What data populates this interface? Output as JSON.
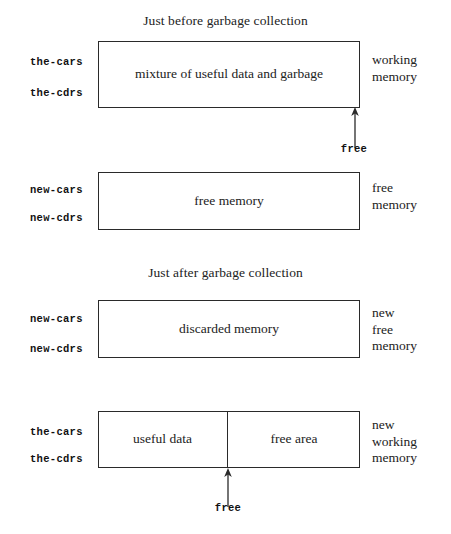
{
  "figure": {
    "stroke_color": "#2a2a2a",
    "text_color": "#222222"
  },
  "captions": {
    "before": "Just before garbage collection",
    "after": "Just after garbage collection"
  },
  "panels": [
    {
      "id": "before-working",
      "pointers": [
        "the-cars",
        "the-cdrs"
      ],
      "box_text": "mixture of useful data and garbage",
      "side_lines": [
        "working",
        "memory"
      ],
      "free_marker": {
        "label": "free",
        "position": "right-edge"
      }
    },
    {
      "id": "before-free",
      "pointers": [
        "new-cars",
        "new-cdrs"
      ],
      "box_text": "free memory",
      "side_lines": [
        "free",
        "memory"
      ],
      "free_marker": null
    },
    {
      "id": "after-discarded",
      "pointers": [
        "new-cars",
        "new-cdrs"
      ],
      "box_text": "discarded memory",
      "side_lines": [
        "new",
        "free",
        "memory"
      ],
      "free_marker": null
    },
    {
      "id": "after-working",
      "pointers": [
        "the-cars",
        "the-cdrs"
      ],
      "box_text_left": "useful data",
      "box_text_right": "free area",
      "side_lines": [
        "new",
        "working",
        "memory"
      ],
      "free_marker": {
        "label": "free",
        "position": "divider"
      }
    }
  ]
}
